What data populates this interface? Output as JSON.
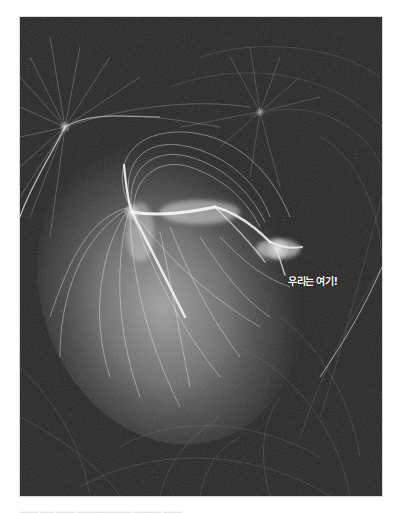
{
  "figure": {
    "style": "grayscale",
    "label": "우리는 여기!",
    "colors": {
      "background": "#262626",
      "page": "#ffffff",
      "glow": "#ffffff",
      "halo": "#9a9a9a"
    }
  },
  "caption": {
    "text": "▂▂▂▂ ▂▂▂ ▂▂▂▂    ▂▂▂▂▂▂▂▂▂▂▂▂ ▂▂▂▂▂▂ ▂▂▂▂"
  }
}
